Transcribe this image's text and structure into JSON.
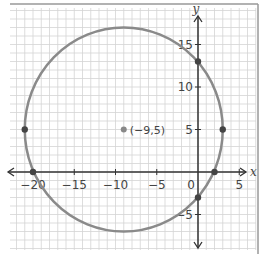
{
  "chart_data": {
    "type": "scatter",
    "title": "",
    "xlabel": "x",
    "ylabel": "y",
    "xlim": [
      -22,
      6
    ],
    "ylim": [
      -8.5,
      19.5
    ],
    "grid": true,
    "legend": null,
    "x_ticks": [
      -20,
      -15,
      -10,
      -5,
      0,
      5
    ],
    "x_tick_labels": [
      "−20",
      "−15",
      "−10",
      "−5",
      "0",
      "5"
    ],
    "y_ticks": [
      -5,
      5,
      10,
      15
    ],
    "y_tick_labels": [
      "−5",
      "5",
      "10",
      "15"
    ],
    "circle": {
      "center": [
        -9,
        5
      ],
      "radius": 12,
      "color": "#8a8a8a"
    },
    "center_point": {
      "x": -9,
      "y": 5,
      "label": "(−9,5)",
      "color": "#888888"
    },
    "points": [
      {
        "x": -21,
        "y": 5
      },
      {
        "x": 3,
        "y": 5
      },
      {
        "x": 0,
        "y": 13
      },
      {
        "x": 0,
        "y": -3
      },
      {
        "x": -20,
        "y": 0
      },
      {
        "x": 2,
        "y": 0
      }
    ],
    "point_color": "#444444",
    "axis_color": "#333333",
    "grid_color": "#d4d4d4"
  }
}
